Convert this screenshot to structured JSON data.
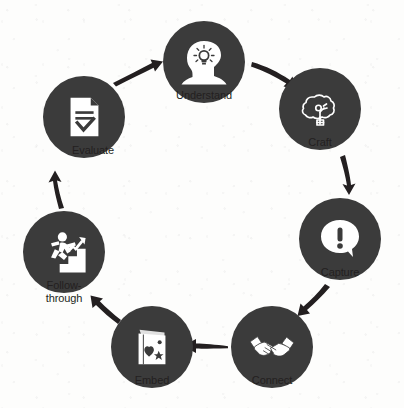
{
  "diagram": {
    "type": "cycle",
    "title": "",
    "background_color": "#fdfdfc",
    "node_color": "#3b3b3b",
    "icon_color": "#ffffff",
    "label_color": "#231f20",
    "arrow_color": "#231f20",
    "direction": "clockwise",
    "nodes": [
      {
        "id": "understand",
        "label": "Understand",
        "icon": "head-lightbulb-icon",
        "cx": 204,
        "cy": 62,
        "r": 41,
        "label_y": 96
      },
      {
        "id": "craft",
        "label": "Craft",
        "icon": "tree-pruning-icon",
        "cx": 320,
        "cy": 109,
        "r": 41,
        "label_y": 143
      },
      {
        "id": "capture",
        "label": "Capture",
        "icon": "speech-bubble-exclamation-icon",
        "cx": 340,
        "cy": 239,
        "r": 41,
        "label_y": 273
      },
      {
        "id": "connect",
        "label": "Connect",
        "icon": "handshake-icon",
        "cx": 272,
        "cy": 347,
        "r": 41,
        "label_y": 381
      },
      {
        "id": "embed",
        "label": "Embed",
        "icon": "card-heart-moon-star-icon",
        "cx": 152,
        "cy": 347,
        "r": 41,
        "label_y": 381
      },
      {
        "id": "follow-through",
        "label": "Follow-\nthrough",
        "icon": "person-climbing-stairs-icon",
        "cx": 64,
        "cy": 252,
        "r": 41,
        "label_y": 286
      },
      {
        "id": "evaluate",
        "label": "Evaluate",
        "icon": "document-checkmark-icon",
        "cx": 84,
        "cy": 117,
        "r": 41,
        "label_y": 151
      }
    ],
    "arrows": [
      {
        "id": "evaluate-to-understand",
        "from": "evaluate",
        "to": "understand"
      },
      {
        "id": "understand-to-craft",
        "from": "understand",
        "to": "craft"
      },
      {
        "id": "craft-to-capture",
        "from": "craft",
        "to": "capture"
      },
      {
        "id": "capture-to-connect",
        "from": "capture",
        "to": "connect"
      },
      {
        "id": "connect-to-embed",
        "from": "connect",
        "to": "embed"
      },
      {
        "id": "embed-to-follow-through",
        "from": "embed",
        "to": "follow-through"
      },
      {
        "id": "follow-through-to-evaluate",
        "from": "follow-through",
        "to": "evaluate"
      }
    ]
  }
}
